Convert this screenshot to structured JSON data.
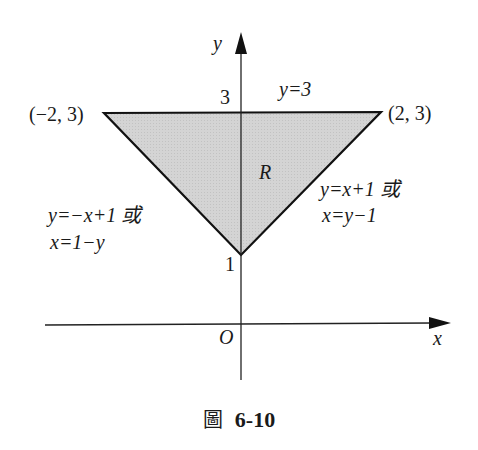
{
  "figure": {
    "caption_prefix": "圖",
    "caption_number": "6-10",
    "axes": {
      "x_label": "x",
      "y_label": "y",
      "origin_label": "O"
    },
    "ticks": {
      "y_tick_3": "3",
      "y_tick_1": "1"
    },
    "region": {
      "label": "R",
      "fill_color": "#d2d2d2",
      "stroke_color": "#111111"
    },
    "vertices": {
      "left": "(−2, 3)",
      "right": "(2, 3)"
    },
    "lines": {
      "top": "y=3",
      "right_line1": "y=x+1 或",
      "right_line2": "x=y−1",
      "left_line1": "y=−x+1 或",
      "left_line2": "x=1−y"
    }
  }
}
